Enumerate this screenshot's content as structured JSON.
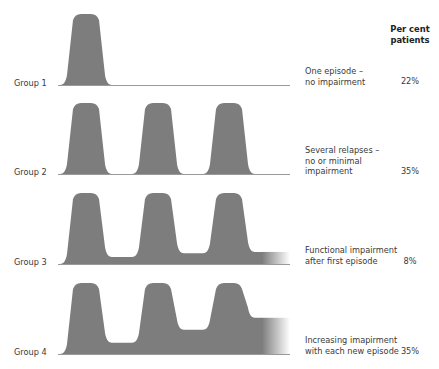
{
  "figure": {
    "column_header": {
      "line1": "Per cent",
      "line2": "patients"
    },
    "fill_color": "#7d7d7d",
    "baseline_color": "#9a9a9a"
  },
  "groups": [
    {
      "label": "Group 1",
      "description": "One episode –\nno impairment",
      "percent": "22%",
      "episodes": 1,
      "residual_impairment_after_each_episode": [
        0
      ]
    },
    {
      "label": "Group 2",
      "description": "Several relapses –\nno or minimal\nimpairment",
      "percent": "35%",
      "episodes": 3,
      "residual_impairment_after_each_episode": [
        0,
        0,
        0
      ]
    },
    {
      "label": "Group 3",
      "description": "Functional impairment\nafter first episode",
      "percent": "8%",
      "episodes": 3,
      "residual_impairment_after_each_episode": [
        0.1,
        0.15,
        0.17
      ]
    },
    {
      "label": "Group 4",
      "description": "Increasing imapirment\nwith each new episode",
      "percent": "35%",
      "episodes": 3,
      "residual_impairment_after_each_episode": [
        0.16,
        0.34,
        0.51
      ]
    }
  ]
}
